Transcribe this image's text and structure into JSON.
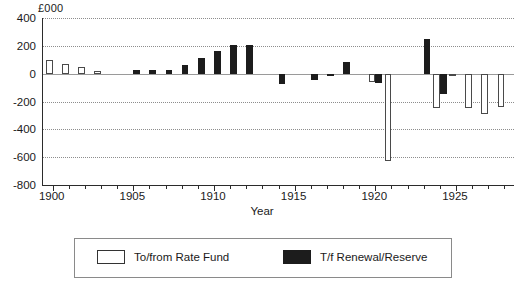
{
  "chart_data": {
    "type": "bar",
    "title": "",
    "unit_label": "£000",
    "xlabel": "Year",
    "ylabel": "",
    "ylim": [
      -800,
      400
    ],
    "ytick_step": 200,
    "yticks": [
      400,
      200,
      0,
      -200,
      -400,
      -600,
      -800
    ],
    "ytick_labels": [
      "400",
      "200",
      "0",
      "-200",
      "-400",
      "-600",
      "-800"
    ],
    "xlim": [
      1899.4,
      1928.6
    ],
    "xticks": [
      1900,
      1901,
      1902,
      1903,
      1904,
      1905,
      1906,
      1907,
      1908,
      1909,
      1910,
      1911,
      1912,
      1913,
      1914,
      1915,
      1916,
      1917,
      1918,
      1919,
      1920,
      1921,
      1922,
      1923,
      1924,
      1925,
      1926,
      1927,
      1928
    ],
    "xtick_major": [
      1900,
      1905,
      1910,
      1915,
      1920,
      1925
    ],
    "xtick_labels": [
      "1900",
      "1905",
      "1910",
      "1915",
      "1920",
      "1925"
    ],
    "grid": true,
    "grid_axis": "y",
    "legend_position": "bottom",
    "categories": [
      1900,
      1901,
      1902,
      1903,
      1904,
      1905,
      1906,
      1907,
      1908,
      1909,
      1910,
      1911,
      1912,
      1913,
      1914,
      1915,
      1916,
      1917,
      1918,
      1919,
      1920,
      1921,
      1922,
      1923,
      1924,
      1925,
      1926,
      1927,
      1928
    ],
    "series": [
      {
        "name": "To/from Rate Fund",
        "color": "#ffffff",
        "edge_color": "#4a4a4a",
        "values": [
          100,
          70,
          45,
          20,
          0,
          0,
          0,
          0,
          0,
          0,
          0,
          0,
          0,
          0,
          0,
          0,
          0,
          0,
          0,
          0,
          -60,
          -630,
          0,
          0,
          -245,
          -10,
          -245,
          -290,
          -240
        ]
      },
      {
        "name": "T/f Renewal/Reserve",
        "color": "#1c1c1c",
        "edge_color": "#1c1c1c",
        "values": [
          0,
          0,
          0,
          0,
          0,
          25,
          25,
          25,
          60,
          115,
          160,
          205,
          205,
          0,
          -75,
          0,
          -45,
          -15,
          85,
          0,
          -70,
          0,
          0,
          250,
          -145,
          0,
          0,
          0,
          0
        ]
      }
    ]
  },
  "legend": {
    "entries": [
      {
        "label": "To/from Rate Fund",
        "swatch": "white"
      },
      {
        "label": "T/f Renewal/Reserve",
        "swatch": "black"
      }
    ]
  }
}
